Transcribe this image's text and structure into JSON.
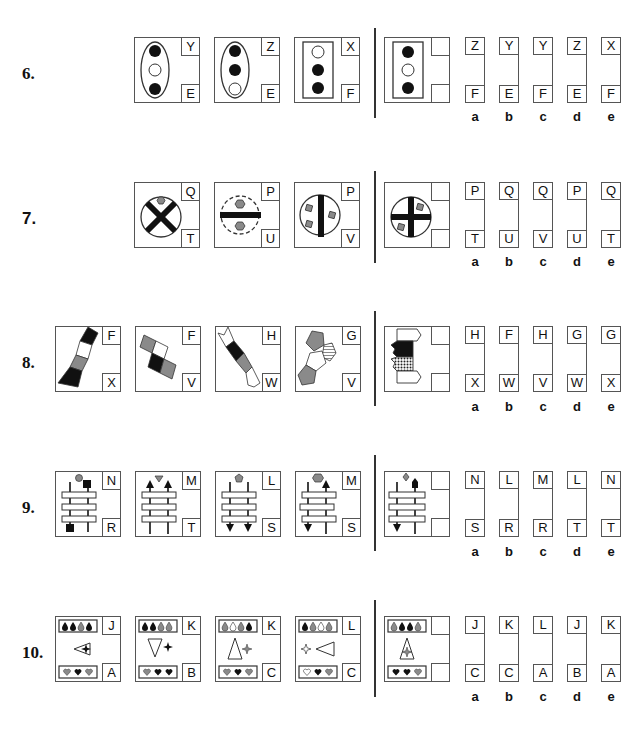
{
  "questions": [
    {
      "number": "6.",
      "figures": [
        {
          "id": "6-1",
          "top": "Y",
          "bottom": "E",
          "desc": "vertical ellipse with black, white, black circles"
        },
        {
          "id": "6-2",
          "top": "Z",
          "bottom": "E",
          "desc": "vertical ellipse with black, black, white circles"
        },
        {
          "id": "6-3",
          "top": "X",
          "bottom": "F",
          "desc": "rectangle with white, black, black circles"
        }
      ],
      "target": {
        "desc": "rectangle with black, white, black circles"
      },
      "options": [
        {
          "label": "a",
          "top": "Z",
          "bottom": "F"
        },
        {
          "label": "b",
          "top": "Y",
          "bottom": "E"
        },
        {
          "label": "c",
          "top": "Y",
          "bottom": "F"
        },
        {
          "label": "d",
          "top": "Z",
          "bottom": "E"
        },
        {
          "label": "e",
          "top": "X",
          "bottom": "F"
        }
      ]
    },
    {
      "number": "7.",
      "figures": [
        {
          "id": "7-1",
          "top": "Q",
          "bottom": "T",
          "desc": "circle with black X, one grey hexagon"
        },
        {
          "id": "7-2",
          "top": "P",
          "bottom": "U",
          "desc": "dashed circle with horizontal bar, two grey hexagons"
        },
        {
          "id": "7-3",
          "top": "P",
          "bottom": "V",
          "desc": "circle with vertical bar, three grey squares"
        }
      ],
      "target": {
        "desc": "circle with black cross, two grey squares"
      },
      "options": [
        {
          "label": "a",
          "top": "P",
          "bottom": "T"
        },
        {
          "label": "b",
          "top": "Q",
          "bottom": "U"
        },
        {
          "label": "c",
          "top": "Q",
          "bottom": "V"
        },
        {
          "label": "d",
          "top": "P",
          "bottom": "U"
        },
        {
          "label": "e",
          "top": "Q",
          "bottom": "T"
        }
      ]
    },
    {
      "number": "8.",
      "figures": [
        {
          "id": "8-1",
          "top": "F",
          "bottom": "X",
          "desc": "chain of four parallelograms black white grey black"
        },
        {
          "id": "8-2",
          "top": "F",
          "bottom": "V",
          "desc": "diagonal squares grey white black grey"
        },
        {
          "id": "8-3",
          "top": "H",
          "bottom": "W",
          "desc": "diagonal chevron strip white black grey white"
        },
        {
          "id": "8-4",
          "top": "G",
          "bottom": "V",
          "desc": "pentagons grey striped white grey"
        }
      ],
      "target": {
        "desc": "stack of arrow shapes white black dotted white"
      },
      "options": [
        {
          "label": "a",
          "top": "H",
          "bottom": "X"
        },
        {
          "label": "b",
          "top": "F",
          "bottom": "W"
        },
        {
          "label": "c",
          "top": "H",
          "bottom": "V"
        },
        {
          "label": "d",
          "top": "G",
          "bottom": "W"
        },
        {
          "label": "e",
          "top": "G",
          "bottom": "X"
        }
      ]
    },
    {
      "number": "9.",
      "figures": [
        {
          "id": "9-1",
          "top": "N",
          "bottom": "R",
          "desc": "ladder with grey circle and black squares"
        },
        {
          "id": "9-2",
          "top": "M",
          "bottom": "T",
          "desc": "ladder with grey triangle, two up arrows"
        },
        {
          "id": "9-3",
          "top": "L",
          "bottom": "S",
          "desc": "ladder with grey pentagon, two down arrows"
        },
        {
          "id": "9-4",
          "top": "M",
          "bottom": "S",
          "desc": "ladder with grey hexagon, down and up arrows"
        }
      ],
      "target": {
        "desc": "ladder with grey diamond, down and up arrows"
      },
      "options": [
        {
          "label": "a",
          "top": "N",
          "bottom": "S"
        },
        {
          "label": "b",
          "top": "L",
          "bottom": "R"
        },
        {
          "label": "c",
          "top": "M",
          "bottom": "R"
        },
        {
          "label": "d",
          "top": "L",
          "bottom": "T"
        },
        {
          "label": "e",
          "top": "N",
          "bottom": "T"
        }
      ]
    },
    {
      "number": "10.",
      "figures": [
        {
          "id": "10-1",
          "top": "J",
          "bottom": "A",
          "desc": "drops and hearts with triangle and star"
        },
        {
          "id": "10-2",
          "top": "K",
          "bottom": "B",
          "desc": "down triangle with star"
        },
        {
          "id": "10-3",
          "top": "K",
          "bottom": "C",
          "desc": "up triangle with star"
        },
        {
          "id": "10-4",
          "top": "L",
          "bottom": "C",
          "desc": "star and left triangle"
        }
      ],
      "target": {
        "desc": "triangle overlapping star"
      },
      "options": [
        {
          "label": "a",
          "top": "J",
          "bottom": "C"
        },
        {
          "label": "b",
          "top": "K",
          "bottom": "C"
        },
        {
          "label": "c",
          "top": "L",
          "bottom": "A"
        },
        {
          "label": "d",
          "top": "J",
          "bottom": "B"
        },
        {
          "label": "e",
          "top": "K",
          "bottom": "A"
        }
      ]
    }
  ],
  "colors": {
    "line": "#555555",
    "black": "#111111",
    "grey": "#8a8a8a"
  }
}
